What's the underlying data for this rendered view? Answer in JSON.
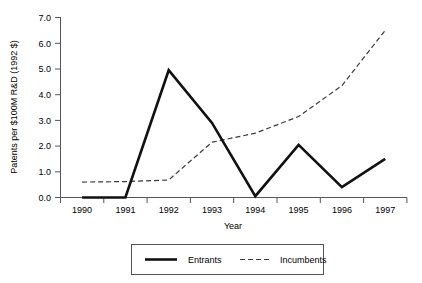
{
  "chart_data": {
    "type": "line",
    "title": "",
    "xlabel": "Year",
    "ylabel": "Patents per $100M R&D (1992 $)",
    "x": [
      1990,
      1991,
      1992,
      1993,
      1994,
      1995,
      1996,
      1997
    ],
    "xtick_labels": [
      "1990",
      "1991",
      "1992",
      "1993",
      "1994",
      "1995",
      "1996",
      "1997"
    ],
    "ytick_labels": [
      "0.0",
      "1.0",
      "2.0",
      "3.0",
      "4.0",
      "5.0",
      "6.0",
      "7.0"
    ],
    "ytick_values": [
      0.0,
      1.0,
      2.0,
      3.0,
      4.0,
      5.0,
      6.0,
      7.0
    ],
    "ylim": [
      0.0,
      7.0
    ],
    "xlim": [
      1990,
      1997
    ],
    "grid": false,
    "legend_position": "bottom",
    "series": [
      {
        "name": "Entrants",
        "style": "solid",
        "color": "#111111",
        "values": [
          0.0,
          0.0,
          4.95,
          2.9,
          0.05,
          2.05,
          0.4,
          1.5
        ]
      },
      {
        "name": "Incumbents",
        "style": "dashed",
        "color": "#3a3a3a",
        "values": [
          0.6,
          0.62,
          0.68,
          2.15,
          2.5,
          3.15,
          4.35,
          6.5
        ]
      }
    ]
  },
  "axes": {
    "x_axis_title": "Year",
    "y_axis_title": "Patents per $100M R&D (1992 $)"
  },
  "legend": {
    "entries": [
      {
        "label": "Entrants",
        "style": "solid"
      },
      {
        "label": "Incumbents",
        "style": "dashed"
      }
    ]
  },
  "ytick_labels": {
    "t0": "0.0",
    "t1": "1.0",
    "t2": "2.0",
    "t3": "3.0",
    "t4": "4.0",
    "t5": "5.0",
    "t6": "6.0",
    "t7": "7.0"
  },
  "xtick_labels": {
    "t0": "1990",
    "t1": "1991",
    "t2": "1992",
    "t3": "1993",
    "t4": "1994",
    "t5": "1995",
    "t6": "1996",
    "t7": "1997"
  }
}
